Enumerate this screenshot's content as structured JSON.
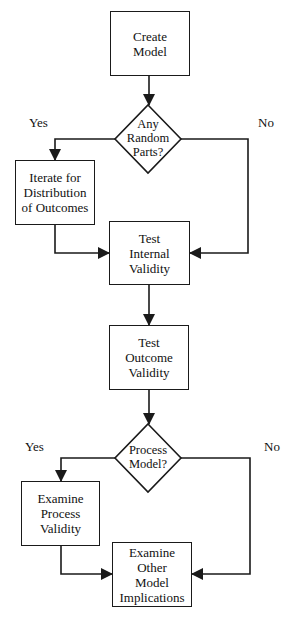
{
  "diagram": {
    "type": "flowchart",
    "nodes": {
      "create_model": {
        "shape": "rectangle",
        "label": "Create\nModel"
      },
      "random_parts": {
        "shape": "diamond",
        "label": "Any\nRandom\nParts?"
      },
      "iterate": {
        "shape": "rectangle",
        "label": "Iterate for\nDistribution\nof Outcomes"
      },
      "test_internal": {
        "shape": "rectangle",
        "label": "Test\nInternal\nValidity"
      },
      "test_outcome": {
        "shape": "rectangle",
        "label": "Test\nOutcome\nValidity"
      },
      "process_model": {
        "shape": "diamond",
        "label": "Process\nModel?"
      },
      "examine_process": {
        "shape": "rectangle",
        "label": "Examine\nProcess\nValidity"
      },
      "examine_other": {
        "shape": "rectangle",
        "label": "Examine Other\nModel\nImplications"
      }
    },
    "branch_labels": {
      "random_yes": "Yes",
      "random_no": "No",
      "process_yes": "Yes",
      "process_no": "No"
    },
    "edges": [
      {
        "from": "create_model",
        "to": "random_parts",
        "label": ""
      },
      {
        "from": "random_parts",
        "to": "iterate",
        "label": "Yes"
      },
      {
        "from": "random_parts",
        "to": "test_internal",
        "label": "No"
      },
      {
        "from": "iterate",
        "to": "test_internal",
        "label": ""
      },
      {
        "from": "test_internal",
        "to": "test_outcome",
        "label": ""
      },
      {
        "from": "test_outcome",
        "to": "process_model",
        "label": ""
      },
      {
        "from": "process_model",
        "to": "examine_process",
        "label": "Yes"
      },
      {
        "from": "process_model",
        "to": "examine_other",
        "label": "No"
      },
      {
        "from": "examine_process",
        "to": "examine_other",
        "label": ""
      }
    ],
    "colors": {
      "stroke": "#1a1a1a",
      "fill": "#ffffff",
      "text": "#111111"
    }
  }
}
